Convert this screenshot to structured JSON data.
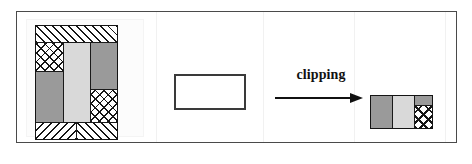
{
  "figure": {
    "caption_label": "clipping",
    "frame": {
      "border_color": "#4a4a4a"
    },
    "colors": {
      "ink": "#161616",
      "mid_gray": "#9a9a9a",
      "light_gray": "#d9d9d9",
      "white": "#ffffff",
      "frame": "#4a4a4a",
      "arrow": "#111111"
    }
  },
  "source_figure": {
    "name": "source-polygon-layout",
    "blocks": [
      {
        "id": "top-band",
        "pattern": "diagonal-forward-hatch",
        "label": ""
      },
      {
        "id": "upper-left-cross",
        "pattern": "cross-hatch",
        "label": ""
      },
      {
        "id": "center-column",
        "pattern": "light-gray-solid",
        "label": ""
      },
      {
        "id": "upper-right",
        "pattern": "mid-gray-solid",
        "label": ""
      },
      {
        "id": "lower-left",
        "pattern": "mid-gray-solid",
        "label": ""
      },
      {
        "id": "lower-right-cross",
        "pattern": "cross-hatch",
        "label": ""
      },
      {
        "id": "bottom-left-band",
        "pattern": "diagonal-backward-hatch",
        "label": ""
      },
      {
        "id": "bottom-right-band",
        "pattern": "diagonal-forward-hatch",
        "label": ""
      }
    ]
  },
  "clip_rectangle": {
    "name": "clip-window",
    "pattern": "empty-outline",
    "label": ""
  },
  "result_figure": {
    "name": "clipped-result",
    "blocks": [
      {
        "id": "result-left",
        "pattern": "mid-gray-solid",
        "label": ""
      },
      {
        "id": "result-center",
        "pattern": "light-gray-solid",
        "label": ""
      },
      {
        "id": "result-right-top",
        "pattern": "mid-gray-solid",
        "label": ""
      },
      {
        "id": "result-right-cross",
        "pattern": "cross-hatch",
        "label": ""
      }
    ]
  }
}
